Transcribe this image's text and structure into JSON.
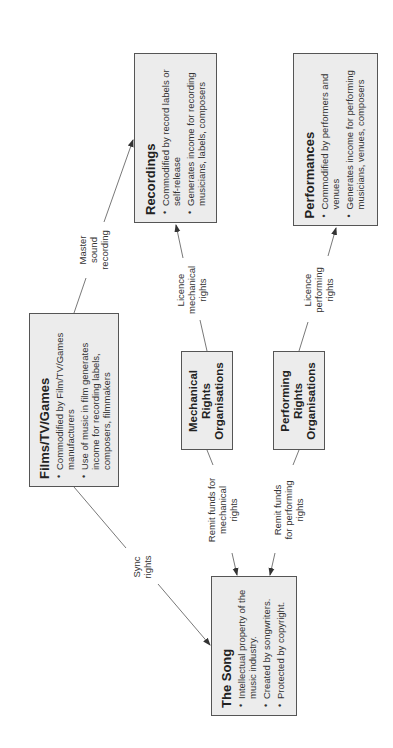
{
  "diagram": {
    "nodes": {
      "recordings": {
        "title": "Recordings",
        "bullets": [
          "Commodified by record labels or self-release",
          "Generates income for recording musicians, labels, composers"
        ]
      },
      "performances": {
        "title": "Performances",
        "bullets": [
          "Commodified by performers and venues",
          "Generates income for performing musicians, venues, composers"
        ]
      },
      "films": {
        "title": "Films/TV/Games",
        "bullets": [
          "Commodified by Film/TV/Games manufacturers",
          "Use of music in film generates income for recording labels, composers, filmmakers"
        ]
      },
      "mechanical": {
        "lines": [
          "Mechanical",
          "Rights",
          "Organisations"
        ]
      },
      "performing": {
        "lines": [
          "Performing",
          "Rights",
          "Organisations"
        ]
      },
      "song": {
        "title": "The Song",
        "bullets": [
          "Intellectual property of the music industry.",
          "Created by songwriters.",
          "Protected by copyright."
        ]
      }
    },
    "edges": {
      "master": {
        "lines": [
          "Master",
          "sound",
          "recording"
        ]
      },
      "licence_mech": {
        "lines": [
          "Licence",
          "mechanical",
          "rights"
        ]
      },
      "licence_perf": {
        "lines": [
          "Licence",
          "performing",
          "rights"
        ]
      },
      "sync": {
        "lines": [
          "Sync",
          "rights"
        ]
      },
      "remit_mech": {
        "lines": [
          "Remit funds for",
          "mechanical",
          "rights"
        ]
      },
      "remit_perf": {
        "lines": [
          "Remit funds",
          "for performing",
          "rights"
        ]
      }
    },
    "colors": {
      "box_fill": "#ececec",
      "box_border": "#555555",
      "line": "#555555"
    }
  }
}
